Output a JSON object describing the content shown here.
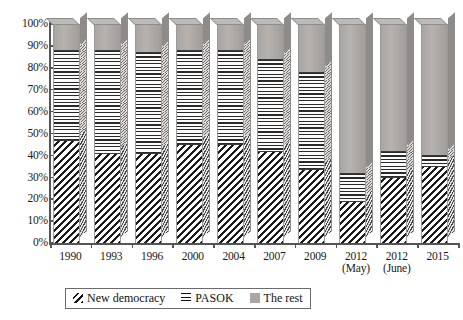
{
  "chart_data": {
    "type": "bar",
    "subtype": "stacked-100-percent-3d-column",
    "title": "",
    "xlabel": "",
    "ylabel": "",
    "ylim": [
      0,
      100
    ],
    "y_tick_labels": [
      "100%",
      "90%",
      "80%",
      "70%",
      "60%",
      "50%",
      "40%",
      "30%",
      "20%",
      "10%",
      "0%"
    ],
    "y_tick_values": [
      100,
      90,
      80,
      70,
      60,
      50,
      40,
      30,
      20,
      10,
      0
    ],
    "grid": false,
    "legend_position": "bottom",
    "categories": [
      {
        "label": "1990",
        "sub": ""
      },
      {
        "label": "1993",
        "sub": ""
      },
      {
        "label": "1996",
        "sub": ""
      },
      {
        "label": "2000",
        "sub": ""
      },
      {
        "label": "2004",
        "sub": ""
      },
      {
        "label": "2007",
        "sub": ""
      },
      {
        "label": "2009",
        "sub": ""
      },
      {
        "label": "2012",
        "sub": "(May)"
      },
      {
        "label": "2012",
        "sub": "(June)"
      },
      {
        "label": "2015",
        "sub": ""
      }
    ],
    "series": [
      {
        "name": "New democracy",
        "pattern": "diagonal-hatch",
        "color": "#1b1b1b",
        "values": [
          47,
          41,
          41,
          45,
          45,
          42,
          34,
          19,
          30,
          35
        ]
      },
      {
        "name": "PASOK",
        "pattern": "horizontal-lines",
        "color": "#2a2a2a",
        "values": [
          41,
          47,
          46,
          43,
          43,
          42,
          44,
          13,
          12,
          5
        ]
      },
      {
        "name": "The rest",
        "pattern": "solid-gray",
        "color": "#a9a6a3",
        "values": [
          12,
          12,
          13,
          12,
          12,
          16,
          22,
          68,
          58,
          60
        ]
      }
    ]
  },
  "legend": {
    "items": [
      {
        "label": "New democracy",
        "swatch": "diagonal-hatch-swatch"
      },
      {
        "label": "PASOK",
        "swatch": "horizontal-lines-swatch"
      },
      {
        "label": "The rest",
        "swatch": "solid-gray-swatch"
      }
    ]
  }
}
